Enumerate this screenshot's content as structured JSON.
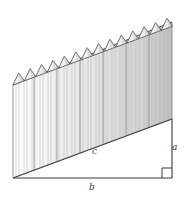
{
  "figure": {
    "type": "geometry-diagram",
    "labels": {
      "a": "a",
      "b": "b",
      "c": "c"
    },
    "annotations": {
      "right_angle_marker": "right-angle-square"
    },
    "geometry": {
      "triangle_vertices": [
        [
          13,
          178
        ],
        [
          172,
          178
        ],
        [
          172,
          119
        ]
      ],
      "fence_top_left": [
        13,
        85
      ],
      "fence_top_right": [
        172,
        22
      ],
      "picket_count": 14,
      "picket_top_shape": "triangle"
    },
    "colors": {
      "outline": "#3a3a3a",
      "picket_fill_light": "#f2f2f2",
      "picket_fill_mid": "#dcdcdc",
      "picket_edge": "#9a9a9a",
      "background": "#ffffff",
      "label": "#3a3a3a"
    }
  }
}
